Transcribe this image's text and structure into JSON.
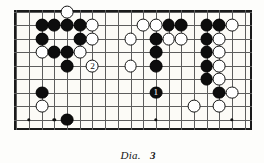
{
  "figure": {
    "caption_label": "Dia.",
    "caption_number": "3",
    "type": "go-game-diagram"
  },
  "board": {
    "x": 14,
    "y": 10,
    "width": 238,
    "height": 120,
    "cols": 19,
    "rows": 9,
    "cell_w": 12.68,
    "cell_h": 13.45,
    "line_color": "#5d5d5d",
    "border_color": "#1a1a1a",
    "background": "#fcfbf7",
    "stone_radius": 6.4,
    "hoshi": [
      {
        "col": 11,
        "row": 3
      },
      {
        "col": 3,
        "row": 8
      },
      {
        "col": 1,
        "row": 8
      },
      {
        "col": 11,
        "row": 8
      },
      {
        "col": 17,
        "row": 8
      }
    ]
  },
  "stones": [
    {
      "col": 4,
      "row": 0,
      "color": "white",
      "label": ""
    },
    {
      "col": 2,
      "row": 1,
      "color": "black",
      "label": ""
    },
    {
      "col": 3,
      "row": 1,
      "color": "black",
      "label": ""
    },
    {
      "col": 4,
      "row": 1,
      "color": "black",
      "label": ""
    },
    {
      "col": 5,
      "row": 1,
      "color": "black",
      "label": ""
    },
    {
      "col": 6,
      "row": 1,
      "color": "white",
      "label": ""
    },
    {
      "col": 10,
      "row": 1,
      "color": "white",
      "label": ""
    },
    {
      "col": 11,
      "row": 1,
      "color": "white",
      "label": ""
    },
    {
      "col": 12,
      "row": 1,
      "color": "black",
      "label": ""
    },
    {
      "col": 13,
      "row": 1,
      "color": "black",
      "label": ""
    },
    {
      "col": 15,
      "row": 1,
      "color": "black",
      "label": ""
    },
    {
      "col": 16,
      "row": 1,
      "color": "black",
      "label": ""
    },
    {
      "col": 17,
      "row": 1,
      "color": "white",
      "label": ""
    },
    {
      "col": 2,
      "row": 2,
      "color": "black",
      "label": ""
    },
    {
      "col": 5,
      "row": 2,
      "color": "black",
      "label": ""
    },
    {
      "col": 6,
      "row": 2,
      "color": "white",
      "label": ""
    },
    {
      "col": 9,
      "row": 2,
      "color": "white",
      "label": ""
    },
    {
      "col": 11,
      "row": 2,
      "color": "black",
      "label": ""
    },
    {
      "col": 12,
      "row": 2,
      "color": "white",
      "label": ""
    },
    {
      "col": 13,
      "row": 2,
      "color": "white",
      "label": ""
    },
    {
      "col": 15,
      "row": 2,
      "color": "black",
      "label": ""
    },
    {
      "col": 16,
      "row": 2,
      "color": "white",
      "label": ""
    },
    {
      "col": 2,
      "row": 3,
      "color": "white",
      "label": ""
    },
    {
      "col": 3,
      "row": 3,
      "color": "black",
      "label": ""
    },
    {
      "col": 4,
      "row": 3,
      "color": "black",
      "label": ""
    },
    {
      "col": 5,
      "row": 3,
      "color": "white",
      "label": ""
    },
    {
      "col": 11,
      "row": 3,
      "color": "black",
      "label": ""
    },
    {
      "col": 15,
      "row": 3,
      "color": "black",
      "label": ""
    },
    {
      "col": 16,
      "row": 3,
      "color": "white",
      "label": ""
    },
    {
      "col": 4,
      "row": 4,
      "color": "black",
      "label": ""
    },
    {
      "col": 6,
      "row": 4,
      "color": "white",
      "label": "2"
    },
    {
      "col": 9,
      "row": 4,
      "color": "white",
      "label": ""
    },
    {
      "col": 11,
      "row": 4,
      "color": "black",
      "label": ""
    },
    {
      "col": 15,
      "row": 4,
      "color": "black",
      "label": ""
    },
    {
      "col": 16,
      "row": 4,
      "color": "white",
      "label": ""
    },
    {
      "col": 15,
      "row": 5,
      "color": "black",
      "label": ""
    },
    {
      "col": 16,
      "row": 5,
      "color": "white",
      "label": ""
    },
    {
      "col": 2,
      "row": 6,
      "color": "black",
      "label": ""
    },
    {
      "col": 11,
      "row": 6,
      "color": "black",
      "label": "1"
    },
    {
      "col": 16,
      "row": 6,
      "color": "black",
      "label": ""
    },
    {
      "col": 17,
      "row": 6,
      "color": "white",
      "label": ""
    },
    {
      "col": 2,
      "row": 7,
      "color": "white",
      "label": ""
    },
    {
      "col": 14,
      "row": 7,
      "color": "white",
      "label": ""
    },
    {
      "col": 16,
      "row": 7,
      "color": "white",
      "label": ""
    },
    {
      "col": 4,
      "row": 8,
      "color": "black",
      "label": ""
    }
  ]
}
